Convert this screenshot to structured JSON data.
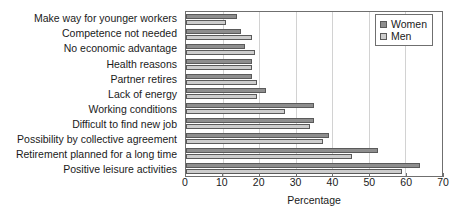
{
  "chart_data": {
    "type": "bar",
    "orientation": "horizontal",
    "title": "",
    "xlabel": "Percentage",
    "ylabel": "",
    "xlim": [
      0,
      70
    ],
    "xticks": [
      0,
      10,
      20,
      30,
      40,
      50,
      60,
      70
    ],
    "grid": "vertical",
    "legend_position": "top-right",
    "categories": [
      "Make way for younger workers",
      "Competence not needed",
      "No economic advantage",
      "Health reasons",
      "Partner retires",
      "Lack of energy",
      "Working conditions",
      "Difficult to find new job",
      "Possibility by collective agreement",
      "Retirement planned for a long time",
      "Positive leisure activities"
    ],
    "series": [
      {
        "name": "Women",
        "color": "#8e8e8e",
        "values": [
          14,
          15,
          16,
          18,
          18,
          22,
          35,
          35,
          39,
          52.5,
          64
        ]
      },
      {
        "name": "Men",
        "color": "#cdcdcd",
        "values": [
          11,
          18,
          19,
          18,
          19.5,
          19.5,
          27,
          34,
          37.5,
          45.5,
          59
        ]
      }
    ]
  }
}
